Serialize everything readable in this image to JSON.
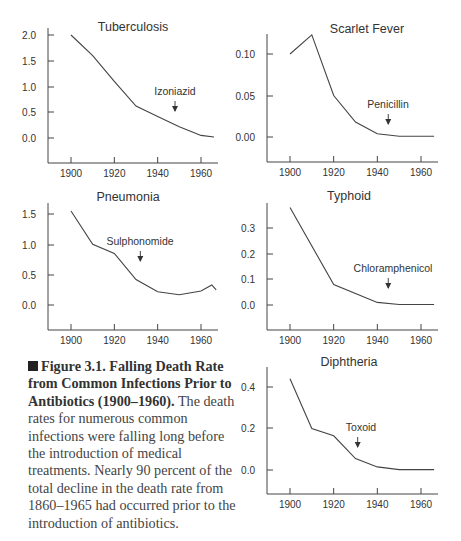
{
  "chart_data": [
    {
      "type": "line",
      "title": "Tuberculosis",
      "x": [
        1900,
        1910,
        1920,
        1930,
        1940,
        1950,
        1960,
        1966
      ],
      "values": [
        2.0,
        1.6,
        1.1,
        0.62,
        0.42,
        0.22,
        0.05,
        0.02
      ],
      "yticks": [
        "2.0",
        "1.5",
        "1.0",
        "0.5",
        "0.0"
      ],
      "xticks": [
        "1900",
        "1920",
        "1940",
        "1960"
      ],
      "ylim": [
        -0.5,
        2.0
      ],
      "annotation": {
        "label": "Izoniazid",
        "year": 1948
      },
      "xlabel": "",
      "ylabel": ""
    },
    {
      "type": "line",
      "title": "Scarlet Fever",
      "x": [
        1900,
        1910,
        1920,
        1930,
        1940,
        1950,
        1960,
        1966
      ],
      "values": [
        0.1,
        0.123,
        0.05,
        0.018,
        0.004,
        0.001,
        0.001,
        0.001
      ],
      "yticks": [
        "0.10",
        "0.05",
        "0.00"
      ],
      "xticks": [
        "1900",
        "1920",
        "1940",
        "1960"
      ],
      "ylim": [
        -0.03,
        0.125
      ],
      "annotation": {
        "label": "Penicillin",
        "year": 1945
      },
      "xlabel": "",
      "ylabel": ""
    },
    {
      "type": "line",
      "title": "Pneumonia",
      "x": [
        1900,
        1910,
        1920,
        1930,
        1940,
        1950,
        1960,
        1965,
        1967
      ],
      "values": [
        1.55,
        1.0,
        0.85,
        0.42,
        0.22,
        0.17,
        0.23,
        0.33,
        0.25
      ],
      "yticks": [
        "1.5",
        "1.0",
        "0.5",
        "0.0"
      ],
      "xticks": [
        "1900",
        "1920",
        "1940",
        "1960"
      ],
      "ylim": [
        -0.4,
        1.7
      ],
      "annotation": {
        "label": "Sulphonomide",
        "year": 1932
      },
      "xlabel": "",
      "ylabel": ""
    },
    {
      "type": "line",
      "title": "Typhoid",
      "x": [
        1900,
        1920,
        1940,
        1950,
        1960,
        1966
      ],
      "values": [
        0.38,
        0.08,
        0.01,
        0.002,
        0.002,
        0.002
      ],
      "yticks": [
        "0.3",
        "0.2",
        "0.1",
        "0.0"
      ],
      "xticks": [
        "1900",
        "1920",
        "1940",
        "1960"
      ],
      "ylim": [
        -0.1,
        0.4
      ],
      "annotation": {
        "label": "Chloramphenicol",
        "year": 1945
      },
      "xlabel": "",
      "ylabel": ""
    },
    {
      "type": "line",
      "title": "Diphtheria",
      "x": [
        1900,
        1910,
        1920,
        1930,
        1940,
        1950,
        1960,
        1966
      ],
      "values": [
        0.44,
        0.2,
        0.165,
        0.055,
        0.015,
        0.002,
        0.002,
        0.002
      ],
      "yticks": [
        "0.4",
        "0.2",
        "0.0"
      ],
      "xticks": [
        "1900",
        "1920",
        "1940",
        "1960"
      ],
      "ylim": [
        -0.12,
        0.48
      ],
      "annotation": {
        "label": "Toxoid",
        "year": 1931
      },
      "xlabel": "",
      "ylabel": ""
    }
  ],
  "caption": {
    "bold": "Figure 3.1. Falling Death Rate from Common Infections Prior to Antibiotics (1900–1960).",
    "text": " The death rates for numerous common infections were falling long before the introduction of medical treatments. Nearly 90 percent of the total decline in the death rate from 1860–1965 had occurred prior to the introduction of antibiotics."
  }
}
